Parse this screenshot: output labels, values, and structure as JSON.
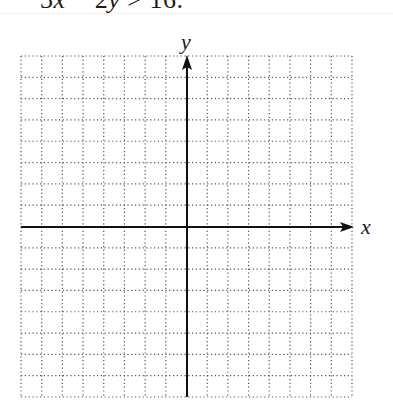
{
  "problem": {
    "parts": [
      {
        "text": "3",
        "italic": false
      },
      {
        "text": "x",
        "italic": true
      },
      {
        "text": " − 2",
        "italic": false
      },
      {
        "text": "y",
        "italic": true
      },
      {
        "text": " > 16.",
        "italic": false
      }
    ],
    "full_text": "3x − 2y > 16."
  },
  "graph": {
    "x_axis_label": "x",
    "y_axis_label": "y",
    "grid": {
      "columns": 16,
      "rows": 16,
      "x_min": -8,
      "x_max": 8,
      "y_min": -8,
      "y_max": 8,
      "line_style": "dotted",
      "line_color": "#555555"
    },
    "axis_color": "#111111"
  }
}
